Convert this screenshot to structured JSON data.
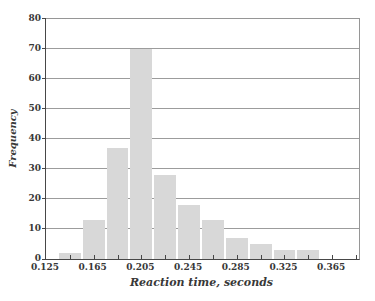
{
  "chart_data": {
    "type": "bar",
    "subtype": "histogram",
    "title": "",
    "xlabel": "Reaction time, seconds",
    "ylabel": "Frequency",
    "bins": {
      "start": 0.135,
      "width": 0.02
    },
    "bin_centers": [
      0.145,
      0.165,
      0.185,
      0.205,
      0.225,
      0.245,
      0.265,
      0.285,
      0.305,
      0.325,
      0.345
    ],
    "values": [
      2,
      13,
      37,
      70,
      28,
      18,
      13,
      7,
      5,
      3,
      3
    ],
    "xlim": [
      0.125,
      0.3875
    ],
    "ylim": [
      0,
      80
    ],
    "x_tick_step": 0.02,
    "x_label_ticks": [
      "0.125",
      "0.165",
      "0.205",
      "0.245",
      "0.285",
      "0.325",
      "0.365"
    ],
    "x_label_values": [
      0.125,
      0.165,
      0.205,
      0.245,
      0.285,
      0.325,
      0.365
    ],
    "y_ticks": [
      0,
      10,
      20,
      30,
      40,
      50,
      60,
      70,
      80
    ],
    "grid": "horizontal",
    "legend": "none",
    "colors": {
      "bar_fill": "#d8d8d8",
      "gridline": "#9c9c9c",
      "axis": "#474747",
      "text": "#383838",
      "background": "#ffffff"
    }
  }
}
